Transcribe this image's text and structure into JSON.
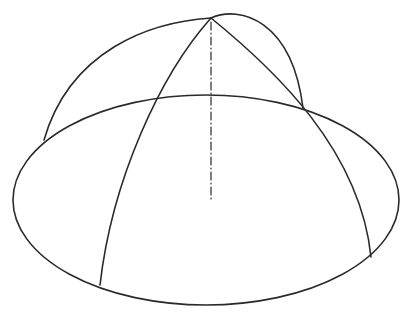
{
  "figure": {
    "caption_fragment": "",
    "stroke_color": "#2a2a2a",
    "background": "#ffffff",
    "base_ellipse": {
      "cx": 206,
      "cy": 200,
      "rx": 193,
      "ry": 105
    },
    "apex": {
      "x": 211,
      "y": 18
    },
    "axis": {
      "x": 211,
      "y_top": 22,
      "y_bottom": 200,
      "style": "dash-dot"
    },
    "arcs": [
      {
        "name": "outer-left-arc",
        "d": "M211,18 C150,22 70,50 44,140"
      },
      {
        "name": "outer-right-arc",
        "d": "M211,18 C240,5 290,20 303,108"
      },
      {
        "name": "left-meridian",
        "d": "M211,18 C160,70 110,180 100,285"
      },
      {
        "name": "right-meridian",
        "d": "M211,18 C280,70 360,150 371,257"
      }
    ]
  }
}
